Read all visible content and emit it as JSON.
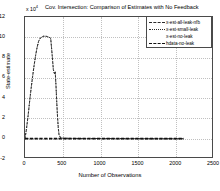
{
  "figure": {
    "title": "Cov. Intersection: Comparison of Estimates with No Feedback",
    "exponent_label": "x 10",
    "exponent_power": "4"
  },
  "axes": {
    "xlabel": "Number of Observations",
    "ylabel": "State-estimate",
    "xticks": [
      "0",
      "500",
      "1000",
      "1500",
      "2000",
      "2500"
    ],
    "yticks": [
      "12",
      "10",
      "8",
      "6",
      "4",
      "2",
      "0",
      "-2"
    ]
  },
  "legend": {
    "items": [
      {
        "label": "x-est-all-leak-nfb",
        "style": "dash-dot"
      },
      {
        "label": "x-est-small-leak",
        "style": "dash-dot"
      },
      {
        "label": "x-est-no-leak",
        "style": "none"
      },
      {
        "label": "hdata-no-leak",
        "style": "thick-dash"
      }
    ]
  },
  "chart_data": {
    "type": "line",
    "title": "Cov. Intersection: Comparison of Estimates with No Feedback",
    "xlabel": "Number of Observations",
    "ylabel": "State-estimate",
    "y_scale": "x 10^4",
    "xlim": [
      0,
      2500
    ],
    "ylim": [
      -2,
      12
    ],
    "grid": true,
    "legend_position": "upper right",
    "series": [
      {
        "name": "x-est-all-leak-nfb",
        "x": [
          0,
          20,
          40,
          60,
          80,
          100,
          120,
          140,
          160,
          180,
          200,
          240,
          280,
          320,
          340,
          360,
          375,
          390,
          400,
          410,
          420,
          430,
          440,
          450,
          470,
          500,
          600,
          800,
          1000,
          1200,
          1400,
          1600,
          1800,
          2000,
          2100
        ],
        "y": [
          0.0,
          1.0,
          2.2,
          3.6,
          4.9,
          6.1,
          7.2,
          8.2,
          9.0,
          9.6,
          9.9,
          10.1,
          10.1,
          10.0,
          9.9,
          8.2,
          6.8,
          6.4,
          6.6,
          5.2,
          3.6,
          2.2,
          1.1,
          0.4,
          0.1,
          0.05,
          0.03,
          0.02,
          0.02,
          0.01,
          0.01,
          0.0,
          0.0,
          0.0,
          0.0
        ]
      },
      {
        "name": "x-est-small-leak",
        "x": [
          0,
          20,
          40,
          60,
          80,
          100,
          120,
          140,
          160,
          180,
          200,
          240,
          280,
          320,
          340,
          360,
          375,
          390,
          400,
          410,
          420,
          430,
          440,
          450,
          470,
          500,
          600,
          800,
          1000,
          1200,
          1400,
          1600,
          1800,
          2000,
          2100
        ],
        "y": [
          0.0,
          1.0,
          2.2,
          3.6,
          4.9,
          6.1,
          7.2,
          8.2,
          9.0,
          9.6,
          9.9,
          10.1,
          10.1,
          10.0,
          9.9,
          8.2,
          6.8,
          6.4,
          6.6,
          5.2,
          3.6,
          2.2,
          1.1,
          0.4,
          0.1,
          0.05,
          0.03,
          0.02,
          0.02,
          0.01,
          0.01,
          0.0,
          0.0,
          0.0,
          0.0
        ]
      },
      {
        "name": "x-est-no-leak",
        "x": [
          0,
          500,
          1000,
          1500,
          2000,
          2100
        ],
        "y": [
          0.0,
          0.0,
          0.0,
          0.0,
          0.0,
          0.0
        ]
      },
      {
        "name": "hdata-no-leak",
        "x": [
          0,
          200,
          400,
          600,
          800,
          1000,
          1200,
          1400,
          1600,
          1800,
          2000,
          2100
        ],
        "y": [
          0.0,
          0.0,
          0.0,
          0.0,
          0.0,
          0.0,
          0.0,
          0.0,
          0.0,
          0.0,
          0.0,
          0.0
        ]
      }
    ]
  }
}
